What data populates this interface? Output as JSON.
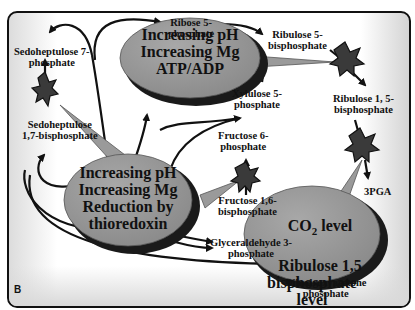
{
  "panel_label": "B",
  "colors": {
    "bubble_fill": "#9a9a9a",
    "bubble_shadow": "#1a1a1a",
    "star_fill": "#3a3a3a",
    "arrow": "#111111"
  },
  "metabolites": {
    "ribose5p": "Ribose 5-\nphosphate",
    "ribulose5bp": "Ribulose 5-\nbisphosphate",
    "sedoheptulose7p": "Sedoheptulose 7-\nphosphate",
    "sedoheptulose17bp": "Sedoheptulose\n1,7-bisphosphate",
    "xylulose5p": "Xylulose 5-\nphosphate",
    "ribulose15bp": "Ribulose 1, 5-\nbisphosphate",
    "fructose6p": "Fructose 6-\nphosphate",
    "fructose16bp": "Fructose 1,6-\nbisphosphate",
    "pga3": "3PGA",
    "glyceraldehyde3p": "Glyceraldehyde 3-\nphosphate",
    "dihydroxyacetonep": "Dihydroxyacetone\nphosphate",
    "hidden_phosphate": "phosphate"
  },
  "regulators": {
    "top": "Increasing pH\nIncreasing Mg\nATP/ADP",
    "middle": "Increasing pH\nIncreasing Mg\nReduction by\nthioredoxin",
    "bottom_line1": "CO",
    "bottom_sub": "2",
    "bottom_line1_rest": " level",
    "bottom_rest": "Ribulose 1,5\nbisphosphate\nlevel"
  }
}
